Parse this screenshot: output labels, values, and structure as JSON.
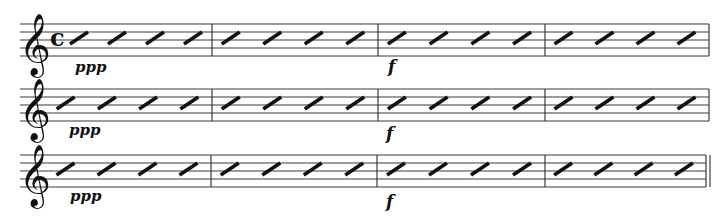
{
  "score": {
    "width": 722,
    "height": 219,
    "staff_left": 20,
    "staff_right": 709,
    "line_spacing": 8,
    "clef": {
      "symbol": "𝄞",
      "name": "treble-clef"
    },
    "time_signature": {
      "symbol": "c",
      "name": "common-time",
      "staff": 0
    },
    "colors": {
      "ink": "#111111",
      "staff_lines": "#3a3a3a",
      "background": "#ffffff"
    },
    "staves": [
      {
        "top": 24,
        "barlines": [
          212,
          378,
          545,
          709
        ],
        "final_barline": "single",
        "measures": [
          {
            "start": 60,
            "end": 212,
            "slashes": 4
          },
          {
            "start": 212,
            "end": 378,
            "slashes": 4
          },
          {
            "start": 378,
            "end": 545,
            "slashes": 4
          },
          {
            "start": 545,
            "end": 709,
            "slashes": 4
          }
        ],
        "dynamics": [
          {
            "text": "ppp",
            "x": 75,
            "y": 72
          },
          {
            "text": "f",
            "x": 388,
            "y": 72
          }
        ]
      },
      {
        "top": 89,
        "barlines": [
          212,
          378,
          545,
          709
        ],
        "final_barline": "single",
        "measures": [
          {
            "start": 47,
            "end": 212,
            "slashes": 4
          },
          {
            "start": 212,
            "end": 378,
            "slashes": 4
          },
          {
            "start": 378,
            "end": 545,
            "slashes": 4
          },
          {
            "start": 545,
            "end": 709,
            "slashes": 4
          }
        ],
        "dynamics": [
          {
            "text": "ppp",
            "x": 69,
            "y": 135
          },
          {
            "text": "f",
            "x": 386,
            "y": 139
          }
        ]
      },
      {
        "top": 155,
        "barlines": [
          211,
          377,
          545,
          706
        ],
        "final_barline": "double",
        "measures": [
          {
            "start": 47,
            "end": 211,
            "slashes": 4
          },
          {
            "start": 211,
            "end": 377,
            "slashes": 4
          },
          {
            "start": 377,
            "end": 545,
            "slashes": 4
          },
          {
            "start": 545,
            "end": 706,
            "slashes": 4
          }
        ],
        "dynamics": [
          {
            "text": "ppp",
            "x": 70,
            "y": 201
          },
          {
            "text": "f",
            "x": 386,
            "y": 207
          }
        ]
      }
    ]
  }
}
